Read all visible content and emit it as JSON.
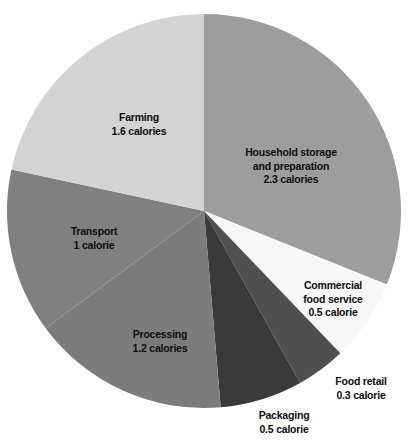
{
  "chart_data": {
    "type": "pie",
    "title": "",
    "subtitle": "",
    "xlabel": "",
    "ylabel": "",
    "unit": "calories",
    "total": 7.4,
    "legend_position": "none",
    "grid": false,
    "start_angle_deg": 0,
    "direction": "clockwise",
    "categories": [
      "Household storage and preparation",
      "Commercial food service",
      "Food retail",
      "Packaging",
      "Processing",
      "Transport",
      "Farming"
    ],
    "values": [
      2.3,
      0.5,
      0.3,
      0.5,
      1.2,
      1.0,
      1.6
    ],
    "colors": [
      "#9d9d9d",
      "#f8f8f8",
      "#4f4f4f",
      "#3a3a3a",
      "#7c7c7c",
      "#808080",
      "#d4d4d4"
    ],
    "slices": [
      {
        "name": "household-storage",
        "label_line1": "Household storage",
        "label_line2": "and preparation",
        "value_label": "2.3 calories",
        "value": 2.3,
        "color": "#9d9d9d",
        "label_x": 291,
        "label_y": 166
      },
      {
        "name": "commercial-food-service",
        "label_line1": "Commercial",
        "label_line2": "food service",
        "value_label": "0.5 calorie",
        "value": 0.5,
        "color": "#f8f8f8",
        "label_x": 333,
        "label_y": 299
      },
      {
        "name": "food-retail",
        "label_line1": "Food retail",
        "label_line2": "",
        "value_label": "0.3 calorie",
        "value": 0.3,
        "color": "#4f4f4f",
        "label_x": 361,
        "label_y": 388
      },
      {
        "name": "packaging",
        "label_line1": "Packaging",
        "label_line2": "",
        "value_label": "0.5 calorie",
        "value": 0.5,
        "color": "#3a3a3a",
        "label_x": 284,
        "label_y": 422
      },
      {
        "name": "processing",
        "label_line1": "Processing",
        "label_line2": "",
        "value_label": "1.2 calories",
        "value": 1.2,
        "color": "#7c7c7c",
        "label_x": 160,
        "label_y": 341
      },
      {
        "name": "transport",
        "label_line1": "Transport",
        "label_line2": "",
        "value_label": "1 calorie",
        "value": 1.0,
        "color": "#808080",
        "label_x": 94,
        "label_y": 238
      },
      {
        "name": "farming",
        "label_line1": "Farming",
        "label_line2": "",
        "value_label": "1.6 calories",
        "value": 1.6,
        "color": "#d4d4d4",
        "label_x": 139,
        "label_y": 124
      }
    ],
    "geometry": {
      "center_x": 204,
      "center_y": 211,
      "radius": 197
    },
    "background": "#ffffff"
  }
}
